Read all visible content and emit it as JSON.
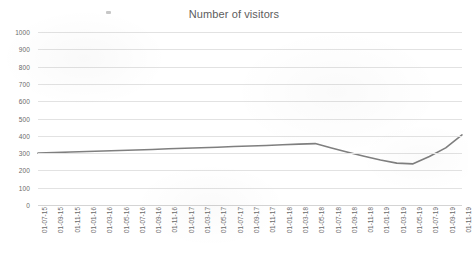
{
  "chart_data": {
    "type": "line",
    "title": "Number of visitors",
    "xlabel": "",
    "ylabel": "",
    "ylim": [
      0,
      1000
    ],
    "ytick_step": 100,
    "grid": true,
    "legend": "none",
    "line_color": "#7f7f7f",
    "yticks": [
      "1000",
      "900",
      "800",
      "700",
      "600",
      "500",
      "400",
      "300",
      "200",
      "100",
      "0"
    ],
    "ytick_values": [
      1000,
      900,
      800,
      700,
      600,
      500,
      400,
      300,
      200,
      100,
      0
    ],
    "categories": [
      "01-07-15",
      "01-09-15",
      "01-11-15",
      "01-01-16",
      "01-03-16",
      "01-05-16",
      "01-07-16",
      "01-09-16",
      "01-11-16",
      "01-01-17",
      "01-03-17",
      "01-05-17",
      "01-07-17",
      "01-09-17",
      "01-11-17",
      "01-01-18",
      "01-03-18",
      "01-05-18",
      "01-07-18",
      "01-09-18",
      "01-11-18",
      "01-01-19",
      "01-03-19",
      "01-05-19",
      "01-07-19",
      "01-09-19",
      "01-11-19"
    ],
    "series": [
      {
        "name": "Number of visitors",
        "values": [
          300,
          303,
          306,
          309,
          312,
          315,
          318,
          321,
          325,
          328,
          331,
          334,
          338,
          341,
          344,
          348,
          352,
          355,
          330,
          305,
          282,
          260,
          242,
          238,
          280,
          330,
          405
        ]
      }
    ]
  },
  "artifacts": {
    "smudge": "scan-smudge"
  }
}
